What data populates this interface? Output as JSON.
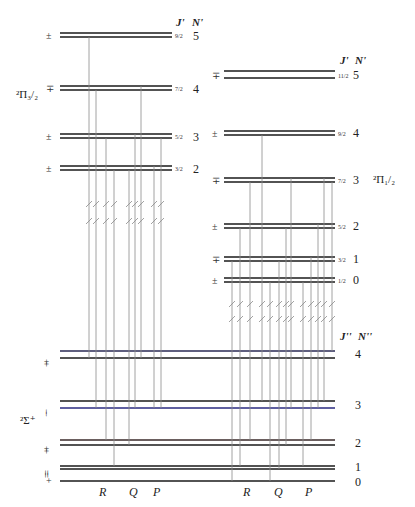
{
  "diagram": {
    "upper_left": {
      "state_label": "²Π₃/₂",
      "header_J": "J'",
      "header_N": "N'",
      "levels": [
        {
          "N": "5",
          "J": "9/2",
          "parity": "±"
        },
        {
          "N": "4",
          "J": "7/2",
          "parity": "∓"
        },
        {
          "N": "3",
          "J": "5/2",
          "parity": "±"
        },
        {
          "N": "2",
          "J": "3/2",
          "parity": "±"
        }
      ]
    },
    "upper_right": {
      "state_label": "²Π₁/₂",
      "header_J": "J'",
      "header_N": "N'",
      "levels": [
        {
          "N": "5",
          "J": "11/2",
          "parity": "∓"
        },
        {
          "N": "4",
          "J": "9/2",
          "parity": "±"
        },
        {
          "N": "3",
          "J": "7/2",
          "parity": "∓"
        },
        {
          "N": "2",
          "J": "5/2",
          "parity": "±"
        },
        {
          "N": "1",
          "J": "3/2",
          "parity": "∓"
        },
        {
          "N": "0",
          "J": "1/2",
          "parity": "±"
        }
      ]
    },
    "lower": {
      "state_label": "²Σ⁺",
      "header_J": "J''",
      "header_N": "N''",
      "levels": [
        {
          "N": "4",
          "parity": "+ +"
        },
        {
          "N": "3",
          "parity": "− −"
        },
        {
          "N": "2",
          "parity": "+ +"
        },
        {
          "N": "1",
          "parity": "= ="
        },
        {
          "N": "0",
          "parity": "+"
        }
      ]
    },
    "branch_labels_left": [
      "R",
      "Q",
      "P"
    ],
    "branch_labels_right": [
      "R",
      "Q",
      "P"
    ]
  }
}
